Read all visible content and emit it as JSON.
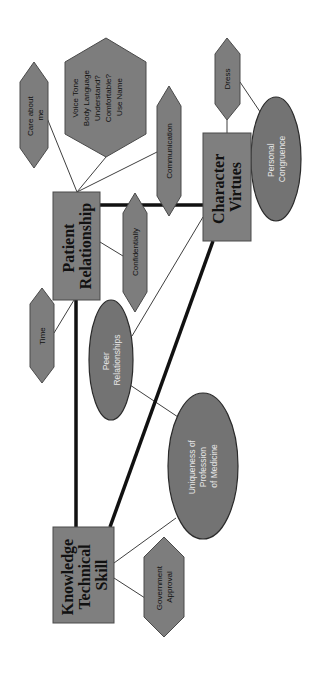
{
  "diagram": {
    "orientation": "rotated 90deg counter-clockwise",
    "colors": {
      "box_fill": "#7f7f7f",
      "hexagon_fill": "#7d7d7d",
      "ellipse_fill": "#737373",
      "thick_connector": "#111111",
      "thin_connector": "#3f3f3f",
      "ellipse_text": "#e6e6e6",
      "background": "#ffffff"
    },
    "boxes": {
      "patient_relationship": {
        "line1": "Patient",
        "line2": "Relationship"
      },
      "character_virtues": {
        "line1": "Character",
        "line2": "Virtues"
      },
      "knowledge": {
        "line1": "Knowledge",
        "line2": "Technical",
        "line3": "Skill"
      }
    },
    "hexagons": {
      "care_about_me": {
        "line1": "Care about",
        "line2": "me"
      },
      "voice": {
        "line1": "Voice Tone",
        "line2": "Body Language",
        "line3": "Understand?",
        "line4": "Comfortable?",
        "line5": "Use Name"
      },
      "communication": {
        "line1": "Communication"
      },
      "confidentially": {
        "line1": "Confidentially"
      },
      "time": {
        "line1": "Time"
      },
      "dress": {
        "line1": "Dress"
      },
      "government_approval": {
        "line1": "Government",
        "line2": "Approval"
      }
    },
    "ellipses": {
      "personal_congruence": {
        "line1": "Personal",
        "line2": "Congruence"
      },
      "peer_relationships": {
        "line1": "Peer",
        "line2": "Relationships"
      },
      "uniqueness": {
        "line1": "Uniqueness of",
        "line2": "Profession",
        "line3": "of Medicine"
      }
    }
  }
}
